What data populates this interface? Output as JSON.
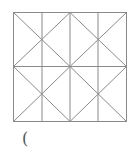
{
  "figure": {
    "stroke_color": "#8a8a8a",
    "square": {
      "x": 13,
      "y": 12,
      "width": 113,
      "height": 109
    }
  },
  "answer_blank": "("
}
